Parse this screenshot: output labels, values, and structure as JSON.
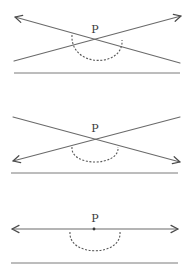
{
  "diagram": {
    "colors": {
      "line": "#6a6a6a",
      "arrow": "#4a4a4a",
      "arc": "#5a5a5a",
      "baseline": "#7a7a7a",
      "label": "#3a3a3a",
      "background": "#ffffff"
    },
    "panels": [
      {
        "id": "panel-1",
        "point_label": "P",
        "label_pos": [
          95,
          33
        ],
        "intersection": [
          95,
          40
        ],
        "lines": [
          {
            "from": [
              180,
              63
            ],
            "to": [
              15,
              17
            ],
            "arrow_at": "to"
          },
          {
            "from": [
              14,
              61
            ],
            "to": [
              181,
              16
            ],
            "arrow_at": "to"
          }
        ],
        "arc": {
          "start": [
            72,
            35
          ],
          "bottom": [
            96,
            66
          ],
          "end": [
            122,
            40
          ]
        },
        "baseline": {
          "y": 73,
          "x1": 14,
          "x2": 180
        }
      },
      {
        "id": "panel-2",
        "point_label": "P",
        "label_pos": [
          95,
          132
        ],
        "intersection": [
          95,
          139
        ],
        "lines": [
          {
            "from": [
              13,
              117
            ],
            "to": [
              180,
              162
            ],
            "arrow_at": "to"
          },
          {
            "from": [
              180,
              117
            ],
            "to": [
              13,
              161
            ],
            "arrow_at": "to"
          }
        ],
        "arc": {
          "start": [
            72,
            147
          ],
          "bottom": [
            96,
            165
          ],
          "end": [
            118,
            147
          ]
        },
        "baseline": {
          "y": 173,
          "x1": 11,
          "x2": 178
        }
      },
      {
        "id": "panel-3",
        "point_label": "P",
        "label_pos": [
          95,
          222
        ],
        "intersection": [
          94,
          229
        ],
        "lines": [
          {
            "from": [
              94,
              229
            ],
            "to": [
              12,
              229
            ],
            "arrow_at": "to"
          },
          {
            "from": [
              94,
              229
            ],
            "to": [
              178,
              229
            ],
            "arrow_at": "to"
          }
        ],
        "arc": {
          "start": [
            70,
            232
          ],
          "bottom": [
            95,
            255
          ],
          "end": [
            120,
            232
          ]
        },
        "baseline": {
          "y": 263,
          "x1": 11,
          "x2": 178
        }
      }
    ]
  }
}
